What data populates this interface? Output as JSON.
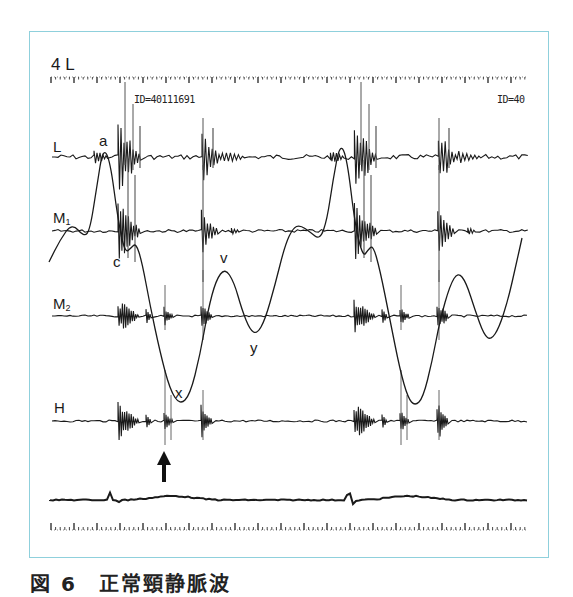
{
  "figure": {
    "lead_label": "4 L",
    "id_left": "ID=40111691",
    "id_right": "ID=40",
    "caption": "図 6　正常頸静脈波",
    "frame_color": "#8fd0dc",
    "trace_color": "#1a1a1a"
  },
  "channels": [
    {
      "key": "L",
      "label": "L",
      "sub": "",
      "baseline_y": 157
    },
    {
      "key": "M1",
      "label": "M",
      "sub": "1",
      "baseline_y": 231
    },
    {
      "key": "M2",
      "label": "M",
      "sub": "2",
      "baseline_y": 316
    },
    {
      "key": "H",
      "label": "H",
      "sub": "",
      "baseline_y": 421
    }
  ],
  "wave_labels": [
    {
      "text": "a",
      "x": 99,
      "y": 133
    },
    {
      "text": "c",
      "x": 113,
      "y": 254
    },
    {
      "text": "v",
      "x": 220,
      "y": 250
    },
    {
      "text": "y",
      "x": 250,
      "y": 340
    },
    {
      "text": "x",
      "x": 175,
      "y": 385
    }
  ],
  "chart_data": {
    "type": "line",
    "xlabel": "time (ruler ticks)",
    "ylabel": "",
    "grid": false,
    "legend": [
      "L",
      "M1",
      "M2",
      "H",
      "JVP",
      "ECG"
    ],
    "annotations": [
      "a",
      "c",
      "x",
      "v",
      "y",
      "arrow at second heart sound (II)"
    ],
    "jvp_points": [
      [
        49,
        262
      ],
      [
        60,
        240
      ],
      [
        72,
        223
      ],
      [
        84,
        237
      ],
      [
        90,
        230
      ],
      [
        97,
        185
      ],
      [
        103,
        148
      ],
      [
        110,
        160
      ],
      [
        118,
        220
      ],
      [
        125,
        253
      ],
      [
        131,
        248
      ],
      [
        136,
        243
      ],
      [
        142,
        262
      ],
      [
        150,
        305
      ],
      [
        160,
        352
      ],
      [
        170,
        390
      ],
      [
        180,
        405
      ],
      [
        190,
        395
      ],
      [
        200,
        355
      ],
      [
        208,
        310
      ],
      [
        216,
        280
      ],
      [
        225,
        268
      ],
      [
        234,
        282
      ],
      [
        242,
        310
      ],
      [
        250,
        330
      ],
      [
        257,
        334
      ],
      [
        265,
        320
      ],
      [
        275,
        285
      ],
      [
        285,
        245
      ],
      [
        293,
        228
      ],
      [
        300,
        225
      ],
      [
        310,
        232
      ],
      [
        320,
        240
      ],
      [
        327,
        220
      ],
      [
        333,
        180
      ],
      [
        340,
        143
      ],
      [
        347,
        158
      ],
      [
        355,
        225
      ],
      [
        363,
        257
      ],
      [
        368,
        250
      ],
      [
        373,
        245
      ],
      [
        380,
        270
      ],
      [
        390,
        320
      ],
      [
        400,
        370
      ],
      [
        408,
        398
      ],
      [
        415,
        406
      ],
      [
        423,
        398
      ],
      [
        432,
        362
      ],
      [
        440,
        320
      ],
      [
        450,
        285
      ],
      [
        458,
        272
      ],
      [
        466,
        282
      ],
      [
        475,
        310
      ],
      [
        484,
        335
      ],
      [
        491,
        340
      ],
      [
        499,
        328
      ],
      [
        508,
        300
      ],
      [
        516,
        265
      ],
      [
        522,
        238
      ]
    ],
    "ecg_baseline_y": 500,
    "ecg_peaks_x": [
      113,
      349
    ],
    "cycles": 2,
    "arrow_x": 164
  }
}
